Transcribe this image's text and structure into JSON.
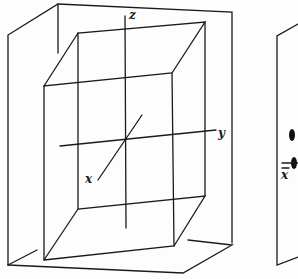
{
  "figure_left": {
    "axis_labels": {
      "z": "z",
      "y": "y",
      "x": "x"
    }
  },
  "figure_right": {
    "axis_labels": {
      "x_bar": "x"
    }
  }
}
